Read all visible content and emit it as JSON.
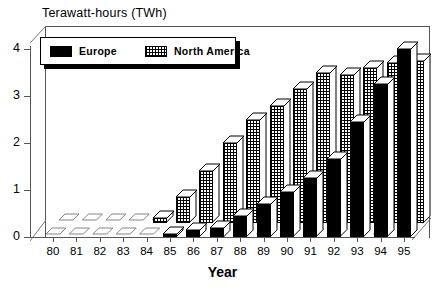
{
  "chart_data": {
    "type": "bar",
    "title": "Terawatt-hours (TWh)",
    "xlabel": "Year",
    "ylabel": "Terawatt-hours (TWh)",
    "categories": [
      "80",
      "81",
      "82",
      "83",
      "84",
      "85",
      "86",
      "87",
      "88",
      "89",
      "90",
      "91",
      "92",
      "93",
      "94",
      "95"
    ],
    "yticks": [
      "0",
      "1",
      "2",
      "3",
      "4"
    ],
    "ylim": [
      0,
      4.4
    ],
    "grid": false,
    "legend_position": "top-left",
    "style": "3d-bar",
    "series": [
      {
        "name": "Europe",
        "fill": "solid-black",
        "color": "#000000",
        "values": [
          0,
          0,
          0,
          0,
          0.02,
          0.05,
          0.15,
          0.2,
          0.45,
          0.7,
          0.95,
          1.25,
          1.65,
          2.45,
          3.25,
          4.0
        ]
      },
      {
        "name": "North America",
        "fill": "hatched-grey",
        "color": "#c8c8c8",
        "values": [
          0,
          0,
          0,
          0.02,
          0.1,
          0.55,
          1.1,
          1.7,
          2.2,
          2.5,
          2.85,
          3.2,
          3.15,
          3.3,
          3.4,
          3.45
        ]
      }
    ]
  },
  "legend": {
    "entries": [
      {
        "label": "Europe",
        "swatch": "solid-black-swatch"
      },
      {
        "label": "North America",
        "swatch": "hatched-swatch"
      }
    ]
  }
}
